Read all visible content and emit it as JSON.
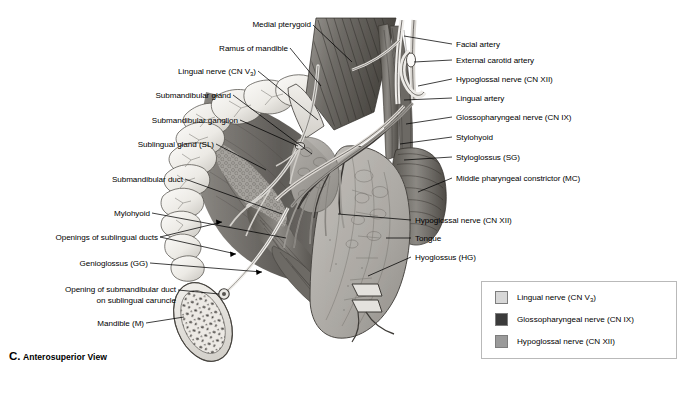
{
  "figure": {
    "caption_letter": "C.",
    "caption_text": "Anterosuperior View",
    "view": "Anterosuperior View"
  },
  "labels_left": [
    {
      "name": "medial-pterygoid",
      "text": "Medial pterygoid"
    },
    {
      "name": "ramus-of-mandible",
      "text": "Ramus of mandible"
    },
    {
      "name": "lingual-nerve-cn-v3",
      "text": "Lingual nerve (CN V",
      "sub": "3",
      "tail": ")"
    },
    {
      "name": "submandibular-gland",
      "text": "Submandibular gland"
    },
    {
      "name": "submandibular-ganglion",
      "text": "Submandibular ganglion"
    },
    {
      "name": "sublingual-gland-sl",
      "text": "Sublingual gland (SL)"
    },
    {
      "name": "submandibular-duct",
      "text": "Submandibular duct"
    },
    {
      "name": "mylohyoid",
      "text": "Mylohyoid"
    },
    {
      "name": "openings-of-sublingual-ducts",
      "text": "Openings of sublingual ducts"
    },
    {
      "name": "genioglossus-gg",
      "text": "Genioglossus (GG)"
    },
    {
      "name": "opening-of-submandibular-duct",
      "text": "Opening of submandibular duct",
      "line2": "on sublingual caruncle"
    },
    {
      "name": "mandible-m",
      "text": "Mandible (M)"
    }
  ],
  "labels_right": [
    {
      "name": "facial-artery",
      "text": "Facial artery"
    },
    {
      "name": "external-carotid-artery",
      "text": "External carotid artery"
    },
    {
      "name": "hypoglossal-nerve-cn-xii-top",
      "text": "Hypoglossal nerve (CN XII)"
    },
    {
      "name": "lingual-artery",
      "text": "Lingual artery"
    },
    {
      "name": "glossopharyngeal-nerve-cn-ix",
      "text": "Glossopharyngeal nerve (CN IX)"
    },
    {
      "name": "stylohyoid",
      "text": "Stylohyoid"
    },
    {
      "name": "styloglossus-sg",
      "text": "Styloglossus (SG)"
    },
    {
      "name": "middle-pharyngeal-constrictor-mc",
      "text": "Middle pharyngeal constrictor (MC)"
    },
    {
      "name": "hypoglossal-nerve-cn-xii",
      "text": "Hypoglossal nerve (CN XII)"
    },
    {
      "name": "tongue",
      "text": "Tongue"
    },
    {
      "name": "hyoglossus-hg",
      "text": "Hyoglossus (HG)"
    }
  ],
  "legend": {
    "items": [
      {
        "name": "legend-lingual-nerve",
        "text": "Lingual nerve (CN V",
        "sub": "3",
        "tail": ")",
        "color": "#d7d7d7"
      },
      {
        "name": "legend-glossopharyngeal-nerve",
        "text": "Glossopharyngeal nerve (CN IX)",
        "color": "#3b3b3b"
      },
      {
        "name": "legend-hypoglossal-nerve",
        "text": "Hypoglossal nerve (CN XII)",
        "color": "#9a9a9a"
      }
    ]
  },
  "colors": {
    "background": "#ffffff",
    "ink": "#000000",
    "legend_border": "#b9b9b9",
    "swatch_border": "#7d7d7d",
    "tooth_light": "#f2f0ec",
    "tooth_shadow": "#c9c6c0",
    "mucosa_dark": "#6d6a66",
    "muscle_mid": "#8e8b86",
    "tongue_gray": "#b3b0ab",
    "bone_pale": "#e6e3de"
  }
}
